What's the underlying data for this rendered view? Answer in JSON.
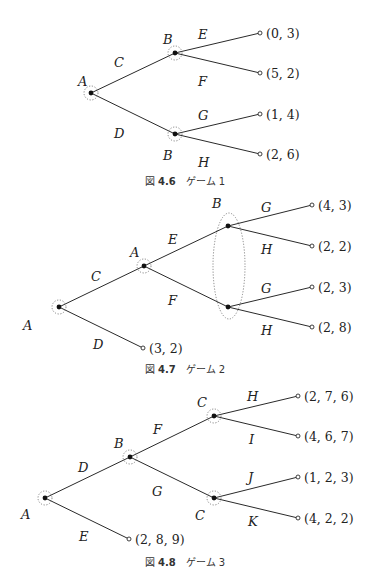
{
  "figures": [
    {
      "id": "fig-4-6",
      "caption": {
        "prefix": "図",
        "number": "4.6",
        "title": "ゲーム 1",
        "x": 185,
        "y": 185
      },
      "nodes": [
        {
          "id": "n0",
          "player": "A",
          "x": 91,
          "y": 93,
          "label_x": 78,
          "label_y": 86,
          "info_circle": true
        },
        {
          "id": "n1",
          "player": "B",
          "x": 175,
          "y": 53,
          "label_x": 163,
          "label_y": 44,
          "info_circle": true
        },
        {
          "id": "n2",
          "player": "B",
          "x": 175,
          "y": 134,
          "label_x": 163,
          "label_y": 160,
          "info_circle": true
        }
      ],
      "edges": [
        {
          "from": "n0",
          "to": "n1",
          "label": "C",
          "label_x": 114,
          "label_y": 67
        },
        {
          "from": "n0",
          "to": "n2",
          "label": "D",
          "label_x": 114,
          "label_y": 138
        },
        {
          "from": "n1",
          "to": "l0",
          "label": "E",
          "label_x": 198,
          "label_y": 39
        },
        {
          "from": "n1",
          "to": "l1",
          "label": "F",
          "label_x": 198,
          "label_y": 86
        },
        {
          "from": "n2",
          "to": "l2",
          "label": "G",
          "label_x": 198,
          "label_y": 120
        },
        {
          "from": "n2",
          "to": "l3",
          "label": "H",
          "label_x": 198,
          "label_y": 167
        }
      ],
      "leaves": [
        {
          "id": "l0",
          "x": 260,
          "y": 33,
          "payoff": "(0, 3)"
        },
        {
          "id": "l1",
          "x": 260,
          "y": 73,
          "payoff": "(5, 2)"
        },
        {
          "id": "l2",
          "x": 260,
          "y": 114,
          "payoff": "(1, 4)"
        },
        {
          "id": "l3",
          "x": 260,
          "y": 154,
          "payoff": "(2, 6)"
        }
      ],
      "info_sets": []
    },
    {
      "id": "fig-4-7",
      "caption": {
        "prefix": "図",
        "number": "4.7",
        "title": "ゲーム 2",
        "x": 185,
        "y": 373
      },
      "nodes": [
        {
          "id": "n0",
          "player": "A",
          "x": 59,
          "y": 307,
          "label_x": 23,
          "label_y": 330,
          "info_circle": true
        },
        {
          "id": "n1",
          "player": "A",
          "x": 144,
          "y": 266,
          "label_x": 130,
          "label_y": 257,
          "info_circle": true
        },
        {
          "id": "n2",
          "player": "B",
          "x": 228,
          "y": 226,
          "label_x": 212,
          "label_y": 208,
          "info_circle": false
        },
        {
          "id": "n3",
          "player": "B",
          "x": 228,
          "y": 307,
          "label_x": null,
          "label_y": null,
          "info_circle": false
        }
      ],
      "edges": [
        {
          "from": "n0",
          "to": "n1",
          "label": "C",
          "label_x": 91,
          "label_y": 281
        },
        {
          "from": "n0",
          "to": "l4",
          "label": "D",
          "label_x": 93,
          "label_y": 349
        },
        {
          "from": "n1",
          "to": "n2",
          "label": "E",
          "label_x": 168,
          "label_y": 244
        },
        {
          "from": "n1",
          "to": "n3",
          "label": "F",
          "label_x": 168,
          "label_y": 305
        },
        {
          "from": "n2",
          "to": "l0",
          "label": "G",
          "label_x": 261,
          "label_y": 212
        },
        {
          "from": "n2",
          "to": "l1",
          "label": "H",
          "label_x": 261,
          "label_y": 254
        },
        {
          "from": "n3",
          "to": "l2",
          "label": "G",
          "label_x": 261,
          "label_y": 293
        },
        {
          "from": "n3",
          "to": "l3",
          "label": "H",
          "label_x": 261,
          "label_y": 335
        }
      ],
      "leaves": [
        {
          "id": "l0",
          "x": 312,
          "y": 205,
          "payoff": "(4, 3)"
        },
        {
          "id": "l1",
          "x": 312,
          "y": 246,
          "payoff": "(2, 2)"
        },
        {
          "id": "l2",
          "x": 312,
          "y": 287,
          "payoff": "(2, 3)"
        },
        {
          "id": "l3",
          "x": 312,
          "y": 327,
          "payoff": "(2, 8)"
        },
        {
          "id": "l4",
          "x": 143,
          "y": 348,
          "payoff": "(3, 2)"
        }
      ],
      "info_sets": [
        {
          "player": "B",
          "cx": 229,
          "cy": 266,
          "rx": 16,
          "ry": 53
        }
      ]
    },
    {
      "id": "fig-4-8",
      "caption": {
        "prefix": "図",
        "number": "4.8",
        "title": "ゲーム 3",
        "x": 185,
        "y": 566
      },
      "nodes": [
        {
          "id": "n0",
          "player": "A",
          "x": 45,
          "y": 498,
          "label_x": 21,
          "label_y": 519,
          "info_circle": true
        },
        {
          "id": "n1",
          "player": "B",
          "x": 130,
          "y": 457,
          "label_x": 114,
          "label_y": 448,
          "info_circle": true
        },
        {
          "id": "n2",
          "player": "C",
          "x": 214,
          "y": 416,
          "label_x": 197,
          "label_y": 407,
          "info_circle": true
        },
        {
          "id": "n3",
          "player": "C",
          "x": 214,
          "y": 498,
          "label_x": 195,
          "label_y": 520,
          "info_circle": true
        }
      ],
      "edges": [
        {
          "from": "n0",
          "to": "n1",
          "label": "D",
          "label_x": 78,
          "label_y": 472
        },
        {
          "from": "n0",
          "to": "l4",
          "label": "E",
          "label_x": 79,
          "label_y": 541
        },
        {
          "from": "n1",
          "to": "n2",
          "label": "F",
          "label_x": 153,
          "label_y": 434
        },
        {
          "from": "n1",
          "to": "n3",
          "label": "G",
          "label_x": 152,
          "label_y": 496
        },
        {
          "from": "n2",
          "to": "l0",
          "label": "H",
          "label_x": 247,
          "label_y": 401
        },
        {
          "from": "n2",
          "to": "l1",
          "label": "I",
          "label_x": 249,
          "label_y": 444
        },
        {
          "from": "n3",
          "to": "l2",
          "label": "J",
          "label_x": 248,
          "label_y": 482
        },
        {
          "from": "n3",
          "to": "l3",
          "label": "K",
          "label_x": 248,
          "label_y": 526
        }
      ],
      "leaves": [
        {
          "id": "l0",
          "x": 298,
          "y": 396,
          "payoff": "(2, 7, 6)"
        },
        {
          "id": "l1",
          "x": 298,
          "y": 436,
          "payoff": "(4, 6, 7)"
        },
        {
          "id": "l2",
          "x": 298,
          "y": 477,
          "payoff": "(1, 2, 3)"
        },
        {
          "id": "l3",
          "x": 298,
          "y": 518,
          "payoff": "(4, 2, 2)"
        },
        {
          "id": "l4",
          "x": 129,
          "y": 539,
          "payoff": "(2, 8, 9)"
        }
      ],
      "info_sets": []
    }
  ]
}
